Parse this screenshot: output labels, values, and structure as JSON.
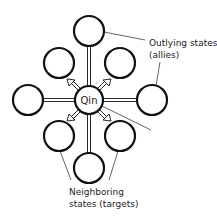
{
  "diagram": {
    "center": {
      "label": "Qin",
      "x": 89,
      "y": 100,
      "r": 14
    },
    "states": [
      {
        "id": "top",
        "x": 89,
        "y": 31,
        "type": "outlying"
      },
      {
        "id": "left",
        "x": 28,
        "y": 100,
        "type": "outlying"
      },
      {
        "id": "right",
        "x": 152,
        "y": 100,
        "type": "outlying"
      },
      {
        "id": "bottom",
        "x": 89,
        "y": 168,
        "type": "outlying"
      },
      {
        "id": "upper-left",
        "x": 59,
        "y": 63,
        "type": "neighboring"
      },
      {
        "id": "upper-right",
        "x": 120,
        "y": 63,
        "type": "neighboring"
      },
      {
        "id": "lower-left",
        "x": 59,
        "y": 136,
        "type": "neighboring"
      },
      {
        "id": "lower-right",
        "x": 120,
        "y": 136,
        "type": "neighboring"
      }
    ],
    "circle_radius": 15,
    "labels": {
      "outlying_line1": "Outlying states",
      "outlying_line2": "(allies)",
      "neighboring_line1": "Neighboring",
      "neighboring_line2": "states (targets)"
    },
    "colors": {
      "stroke": "#111111",
      "text": "#222222",
      "background": "#ffffff"
    }
  }
}
